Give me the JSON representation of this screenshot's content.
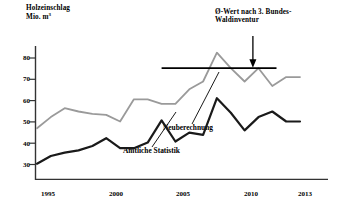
{
  "chart_data": {
    "type": "line",
    "title": "Holzeinschlag",
    "subtitle": "Mio. m",
    "subtitle_sup": "3",
    "xlabel": "",
    "ylabel": "Holzeinschlag Mio. m3",
    "xlim": [
      1994,
      2013.6
    ],
    "ylim": [
      26,
      86
    ],
    "yticks": [
      30,
      40,
      50,
      60,
      70,
      80
    ],
    "xticks": [
      1995,
      2000,
      2005,
      2010,
      2013
    ],
    "xtick_labels": [
      "1995",
      "2000",
      "2005",
      "2010",
      "2013"
    ],
    "grid": false,
    "legend": "inline-annotations",
    "x": [
      1994,
      1995,
      1996,
      1997,
      1998,
      1999,
      2000,
      2001,
      2002,
      2003,
      2004,
      2005,
      2006,
      2007,
      2008,
      2009,
      2010,
      2011,
      2012,
      2013
    ],
    "series": [
      {
        "name": "Amtliche Statistik",
        "color": "#1a1a1a",
        "values": [
          33,
          36.5,
          38,
          39,
          41,
          44.5,
          40,
          40,
          42.5,
          52.5,
          43,
          47,
          46,
          62.5,
          56,
          48,
          54,
          56.5,
          52,
          52
        ]
      },
      {
        "name": "Neuberechnung",
        "color": "#9a9a9a",
        "values": [
          49,
          54,
          58,
          56.5,
          55.5,
          55,
          52,
          62,
          62,
          60,
          60,
          66.5,
          70,
          83,
          76,
          70,
          76,
          68,
          72,
          72
        ]
      }
    ],
    "reference_line": {
      "label": "Ø-Wert nach 3. Bundes-Waldinventur",
      "value": 76,
      "x_start": 2003.0,
      "x_end": 2011.3,
      "color": "#000000",
      "arrow_x": 2009.6
    },
    "annotations": [
      {
        "name": "Neuberechnung",
        "text": "Neuberechnung"
      },
      {
        "name": "Amtliche Statistik",
        "text": "Amtliche Statistik"
      }
    ]
  },
  "axis": {
    "y_title_line1": "Holzeinschlag",
    "y_title_line2": "Mio. m",
    "y_title_sup": "3",
    "ytick_labels": [
      "80",
      "70",
      "60",
      "50",
      "40",
      "30"
    ],
    "xtick_labels": [
      "1995",
      "2000",
      "2005",
      "2010",
      "2013"
    ]
  },
  "annotation": {
    "avg_line1": "Ø-Wert nach 3. Bundes-",
    "avg_line2": "Waldinventur",
    "series_new": "Neuberechnung",
    "series_official": "Amtliche Statistik"
  }
}
